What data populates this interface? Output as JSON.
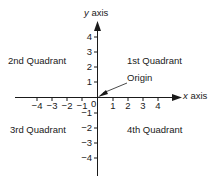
{
  "diagram": {
    "axes": {
      "x_label_var": "x",
      "x_label_word": " axis",
      "y_label_var": "y",
      "y_label_word": " axis"
    },
    "quadrants": {
      "q1": "1st Quadrant",
      "q2": "2nd Quadrant",
      "q3": "3rd Quadrant",
      "q4": "4th Quadrant"
    },
    "origin_label": "Origin",
    "origin_value": "0",
    "x_ticks_negative": [
      "−4",
      "−3",
      "−2",
      "−1"
    ],
    "x_ticks_positive": [
      "1",
      "2",
      "3",
      "4"
    ],
    "y_ticks_positive": [
      "4",
      "3",
      "2",
      "1"
    ],
    "y_ticks_negative": [
      "−1",
      "−2",
      "−3",
      "−4"
    ],
    "colors": {
      "ink": "#1a1a1a",
      "background": "#ffffff"
    }
  }
}
